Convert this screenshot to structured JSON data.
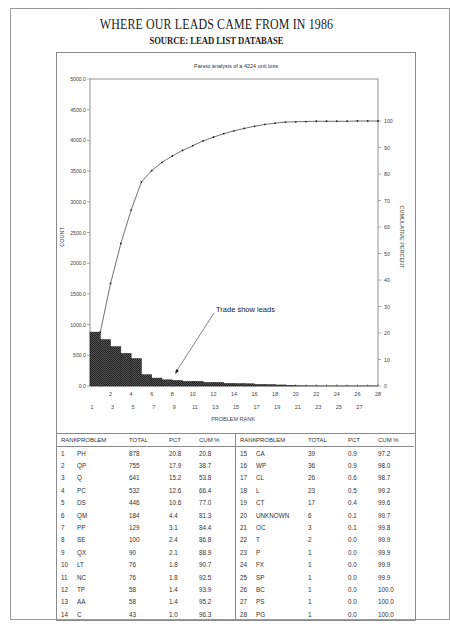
{
  "header": {
    "title": "WHERE OUR LEADS CAME FROM IN 1986",
    "subtitle": "SOURCE: LEAD LIST DATABASE"
  },
  "chart_data": {
    "type": "bar",
    "subtype": "pareto (bar + cumulative line)",
    "title": "Pareto analysis of a 4224 unit loss",
    "xlabel": "PROBLEM RANK",
    "ylabel": "COUNT",
    "y2label": "CUMULATIVE PERCENT",
    "ylim": [
      0,
      5000
    ],
    "y2lim": [
      0,
      100
    ],
    "yticks": [
      "0.0",
      "500.0",
      "1000.0",
      "1500.0",
      "2000.0",
      "2500.0",
      "3000.0",
      "3500.0",
      "4000.0",
      "4500.0",
      "5000.0"
    ],
    "y2ticks": [
      "0",
      "10",
      "20",
      "30",
      "40",
      "50",
      "60",
      "70",
      "80",
      "90",
      "100"
    ],
    "xticks_upper": [
      "2",
      "4",
      "6",
      "8",
      "10",
      "12",
      "14",
      "16",
      "18",
      "20",
      "22",
      "24",
      "26",
      "28"
    ],
    "xticks_lower": [
      "1",
      "3",
      "5",
      "7",
      "9",
      "11",
      "13",
      "15",
      "17",
      "19",
      "21",
      "23",
      "25",
      "27"
    ],
    "categories": [
      1,
      2,
      3,
      4,
      5,
      6,
      7,
      8,
      9,
      10,
      11,
      12,
      13,
      14,
      15,
      16,
      17,
      18,
      19,
      20,
      21,
      22,
      23,
      24,
      25,
      26,
      27,
      28
    ],
    "series": [
      {
        "name": "Count",
        "type": "bar",
        "values": [
          878,
          755,
          641,
          532,
          446,
          184,
          129,
          100,
          90,
          76,
          76,
          58,
          58,
          43,
          39,
          36,
          26,
          23,
          17,
          6,
          3,
          2,
          1,
          1,
          1,
          1,
          1,
          1
        ]
      },
      {
        "name": "Cumulative",
        "type": "line",
        "axis": "y2",
        "values": [
          20.8,
          38.7,
          53.8,
          66.4,
          77.0,
          81.3,
          84.4,
          86.8,
          88.9,
          90.7,
          92.5,
          93.9,
          95.2,
          96.3,
          97.2,
          98.0,
          98.7,
          99.2,
          99.6,
          99.7,
          99.8,
          99.9,
          99.9,
          99.9,
          99.9,
          100.0,
          100.0,
          100.0
        ]
      }
    ],
    "annotations": [
      {
        "text": "Trade show leads",
        "points_to_rank": 9
      }
    ],
    "grid": false,
    "legend": "none"
  },
  "table": {
    "headers": [
      "RANK",
      "PROBLEM",
      "TOTAL",
      "PCT",
      "CUM %"
    ],
    "left_rows": [
      [
        "1",
        "PH",
        "878",
        "20.8",
        "20.8"
      ],
      [
        "2",
        "QP",
        "755",
        "17.9",
        "38.7"
      ],
      [
        "3",
        "Q",
        "641",
        "15.2",
        "53.8"
      ],
      [
        "4",
        "PC",
        "532",
        "12.6",
        "66.4"
      ],
      [
        "5",
        "DS",
        "446",
        "10.6",
        "77.0"
      ],
      [
        "6",
        "QM",
        "184",
        "4.4",
        "81.3"
      ],
      [
        "7",
        "PP",
        "129",
        "3.1",
        "84.4"
      ],
      [
        "8",
        "SE",
        "100",
        "2.4",
        "86.8"
      ],
      [
        "9",
        "QX",
        "90",
        "2.1",
        "88.9"
      ],
      [
        "10",
        "LT",
        "76",
        "1.8",
        "90.7"
      ],
      [
        "11",
        "NC",
        "76",
        "1.8",
        "92.5"
      ],
      [
        "12",
        "TP",
        "58",
        "1.4",
        "93.9"
      ],
      [
        "13",
        "AA",
        "58",
        "1.4",
        "95.2"
      ],
      [
        "14",
        "C",
        "43",
        "1.0",
        "96.3"
      ]
    ],
    "right_rows": [
      [
        "15",
        "CA",
        "39",
        "0.9",
        "97.2"
      ],
      [
        "16",
        "WP",
        "36",
        "0.9",
        "98.0"
      ],
      [
        "17",
        "CL",
        "26",
        "0.6",
        "98.7"
      ],
      [
        "18",
        "L",
        "23",
        "0.5",
        "99.2"
      ],
      [
        "19",
        "CT",
        "17",
        "0.4",
        "99.6"
      ],
      [
        "20",
        "UNKNOWN",
        "6",
        "0.1",
        "99.7"
      ],
      [
        "21",
        "OC",
        "3",
        "0.1",
        "99.8"
      ],
      [
        "22",
        "T",
        "2",
        "0.0",
        "99.9"
      ],
      [
        "23",
        "P",
        "1",
        "0.0",
        "99.9"
      ],
      [
        "24",
        "FX",
        "1",
        "0.0",
        "99.9"
      ],
      [
        "25",
        "SP",
        "1",
        "0.0",
        "99.9"
      ],
      [
        "26",
        "BC",
        "1",
        "0.0",
        "100.0"
      ],
      [
        "27",
        "PS",
        "1",
        "0.0",
        "100.0"
      ],
      [
        "28",
        "PG",
        "1",
        "0.0",
        "100.0"
      ]
    ]
  }
}
